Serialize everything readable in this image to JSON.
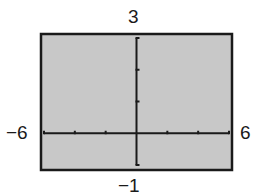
{
  "chart_data": {
    "type": "line",
    "title": "",
    "xlabel": "",
    "ylabel": "",
    "xlim": [
      -6,
      6
    ],
    "ylim": [
      -1,
      3
    ],
    "xscale": 2,
    "yscale": 1,
    "grid": false,
    "series": [],
    "window_labels": {
      "ymax": "3",
      "ymin": "−1",
      "xmin": "−6",
      "xmax": "6"
    },
    "colors": {
      "background": "#c8c8c8",
      "frame": "#1a1a1a",
      "axes": "#1a1a1a"
    }
  }
}
